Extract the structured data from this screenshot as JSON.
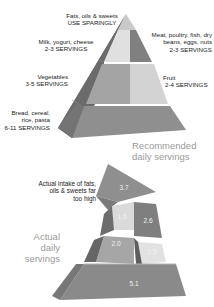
{
  "recommended": {
    "caption_line1": "Recommended",
    "caption_line2": "daily servings",
    "groups": [
      {
        "id": "fats",
        "name": "Fats, oils & sweets",
        "servings": "USE SPARINGLY"
      },
      {
        "id": "dairy",
        "name": "Milk, yogurt, cheese",
        "servings": "2-3 SERVINGS"
      },
      {
        "id": "protein",
        "name_line1": "Meat, poultry, fish, dry",
        "name_line2": "beans, eggs, nuts",
        "servings": "2-3 SERVINGS"
      },
      {
        "id": "vegetables",
        "name": "Vegetables",
        "servings": "3-5 SERVINGS"
      },
      {
        "id": "fruit",
        "name": "Fruit",
        "servings": "2-4 SERVINGS"
      },
      {
        "id": "grains",
        "name_line1": "Bread, cereal,",
        "name_line2": "rice, pasta",
        "servings": "6-11 SERVINGS"
      }
    ]
  },
  "actual": {
    "caption_line1": "Actual",
    "caption_line2": "daily",
    "caption_line3": "servings",
    "annotation_line1": "Actual intake of fats,",
    "annotation_line2": "oils & sweets far",
    "annotation_line3": "too high",
    "values": {
      "fats": "3.7",
      "dairy": "1.5",
      "protein": "2.6",
      "vegetables": "2.0",
      "fruit": "1.5",
      "grains": "5.1"
    }
  },
  "colors": {
    "dark_face": "#7d7d7d",
    "mid_face": "#9c9c9c",
    "light_face": "#c8c8c8",
    "pale_face": "#dcdcdc",
    "side_face": "#6a6a6a",
    "caption_gray": "#9a9a9a"
  }
}
